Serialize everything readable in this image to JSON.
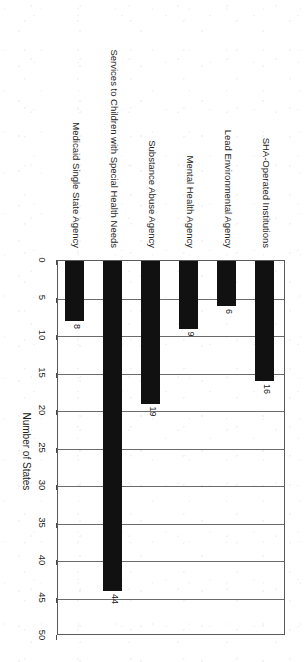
{
  "chart_data": {
    "type": "bar",
    "orientation": "vertical-rotated-90",
    "title": "",
    "subtitle": "",
    "xlabel": "",
    "ylabel": "Number of States",
    "ylim": [
      0,
      50
    ],
    "ytick_step": 5,
    "grid": true,
    "legend": false,
    "bar_color": "#111111",
    "categories": [
      "SHA-Operated Institutions",
      "Lead Environmental Agency",
      "Mental Health Agency",
      "Substance Abuse Agency",
      "Services to Children with Special Health Needs",
      "Medicaid Single State Agency"
    ],
    "values": [
      16,
      6,
      9,
      19,
      44,
      8
    ],
    "tick_labels": [
      "0",
      "5",
      "10",
      "15",
      "20",
      "25",
      "30",
      "35",
      "40",
      "45",
      "50"
    ],
    "tick_values": [
      0,
      5,
      10,
      15,
      20,
      25,
      30,
      35,
      40,
      45,
      50
    ],
    "data_labels": [
      "16",
      "6",
      "9",
      "19",
      "44",
      "8"
    ]
  },
  "axis": {
    "title": "Number of States"
  }
}
